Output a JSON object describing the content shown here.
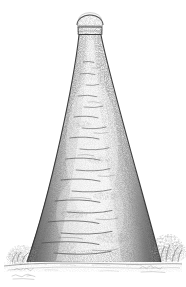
{
  "artwork": {
    "title": "Bottle Kiln",
    "subject": "conical brick bottle oven with domed cap",
    "medium": "pen and ink stipple engraving",
    "background_color": "#ffffff",
    "ink_color": "#4a4a4a",
    "dark_ink_color": "#2e2e2e",
    "light_ink_color": "#9a9a9a",
    "canvas": {
      "width": 186,
      "height": 287
    }
  },
  "structure": {
    "cap": {
      "name": "domed cap",
      "dome_center_x": 90,
      "dome_center_y": 24,
      "dome_rx": 13,
      "dome_ry": 9,
      "collar_top_y": 24,
      "collar_bottom_y": 35,
      "collar_left_x": 78,
      "collar_right_x": 102
    },
    "cone": {
      "name": "tapered brick cone",
      "apex_left_x": 79,
      "apex_right_x": 101,
      "apex_y": 35,
      "base_left_x": 27,
      "base_right_x": 161,
      "base_y": 263,
      "mid_left_x": 69,
      "mid_right_x": 126,
      "mid_y": 143
    },
    "ground": {
      "name": "ground line",
      "left_x": 4,
      "right_x": 182,
      "y": 264
    }
  },
  "scene_elements": [
    {
      "id": "dome-cap",
      "label": "Domed cap",
      "interactable": false
    },
    {
      "id": "cap-collar",
      "label": "Cap collar band",
      "interactable": false
    },
    {
      "id": "cone-body",
      "label": "Brick cone body",
      "interactable": false
    },
    {
      "id": "cone-left-edge",
      "label": "Left shaded edge",
      "interactable": false
    },
    {
      "id": "cone-right-edge",
      "label": "Right shaded edge",
      "interactable": false
    },
    {
      "id": "brick-courses",
      "label": "Horizontal brick courses",
      "interactable": false
    },
    {
      "id": "shrub-left",
      "label": "Shrub at left base",
      "interactable": false
    },
    {
      "id": "shrub-right",
      "label": "Shrub at right base",
      "interactable": false
    },
    {
      "id": "ground-line",
      "label": "Ground line",
      "interactable": false
    },
    {
      "id": "signature-left",
      "label": "Artist signature (left)",
      "interactable": false
    },
    {
      "id": "signature-right",
      "label": "Artist signature (right)",
      "interactable": false
    }
  ],
  "signatures": {
    "left": "illegible pencil signature",
    "right": "illegible pencil signature"
  }
}
